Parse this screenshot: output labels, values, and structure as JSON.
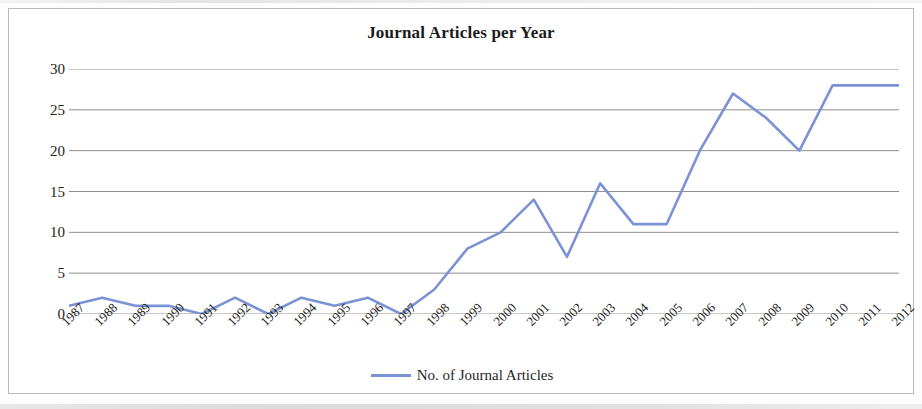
{
  "chart_data": {
    "type": "line",
    "title": "Journal Articles per Year",
    "xlabel": "",
    "ylabel": "",
    "ylim": [
      0,
      30
    ],
    "yticks": [
      0,
      5,
      10,
      15,
      20,
      25,
      30
    ],
    "grid": true,
    "legend_position": "bottom",
    "line_color": "#7b92d4",
    "categories": [
      "1987",
      "1988",
      "1989",
      "1990",
      "1991",
      "1992",
      "1993",
      "1994",
      "1995",
      "1996",
      "1997",
      "1998",
      "1999",
      "2000",
      "2001",
      "2002",
      "2003",
      "2004",
      "2005",
      "2006",
      "2007",
      "2008",
      "2009",
      "2010",
      "2011",
      "2012"
    ],
    "series": [
      {
        "name": "No. of Journal Articles",
        "values": [
          1,
          2,
          1,
          1,
          0,
          2,
          0,
          2,
          1,
          2,
          0,
          3,
          8,
          10,
          14,
          7,
          16,
          11,
          11,
          20,
          27,
          24,
          20,
          28,
          28,
          28
        ]
      }
    ]
  },
  "legend": {
    "entry_label": "No. of Journal Articles",
    "swatch_color": "#7b92d4"
  },
  "axis": {
    "y_tick_labels": [
      "30",
      "25",
      "20",
      "15",
      "10",
      "5",
      "0"
    ]
  }
}
